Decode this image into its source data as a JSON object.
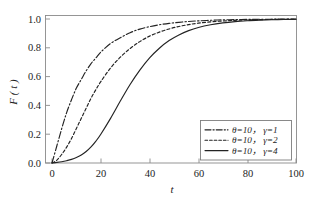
{
  "figure": {
    "background_color": "#ffffff",
    "frame_color": "#8a8a8a",
    "curve_color": "#232323"
  },
  "chart_data": {
    "type": "line",
    "title": "",
    "subtitle": "",
    "xlabel": "t",
    "ylabel": "F ( t )",
    "xlim": [
      0,
      100
    ],
    "ylim": [
      0.0,
      1.0
    ],
    "grid": false,
    "legend_position": "lower right",
    "xticks": [
      0,
      20,
      40,
      60,
      80,
      100
    ],
    "xtick_labels": [
      "0",
      "20",
      "40",
      "60",
      "80",
      "100"
    ],
    "yticks": [
      0.0,
      0.2,
      0.4,
      0.6,
      0.8,
      1.0
    ],
    "ytick_labels": [
      "0.0",
      "0.2",
      "0.4",
      "0.6",
      "0.8",
      "1.0"
    ],
    "x": [
      0,
      2,
      4,
      6,
      8,
      10,
      12,
      14,
      16,
      18,
      20,
      24,
      28,
      32,
      36,
      40,
      44,
      48,
      52,
      56,
      60,
      65,
      70,
      75,
      80,
      85,
      90,
      95,
      100
    ],
    "series": [
      {
        "name": "theta=10, gamma=1",
        "label": "θ=10， γ=1",
        "linestyle": "dashdot",
        "color": "#232323",
        "values": [
          0.0,
          0.12,
          0.24,
          0.35,
          0.44,
          0.52,
          0.58,
          0.64,
          0.69,
          0.73,
          0.77,
          0.83,
          0.87,
          0.905,
          0.93,
          0.947,
          0.96,
          0.97,
          0.977,
          0.983,
          0.987,
          0.991,
          0.994,
          0.9955,
          0.997,
          0.998,
          0.9985,
          0.999,
          0.9993
        ]
      },
      {
        "name": "theta=10, gamma=2",
        "label": "θ=10， γ=2",
        "linestyle": "dashed",
        "color": "#232323",
        "values": [
          0.0,
          0.02,
          0.06,
          0.11,
          0.17,
          0.24,
          0.31,
          0.38,
          0.45,
          0.51,
          0.565,
          0.66,
          0.735,
          0.795,
          0.843,
          0.881,
          0.909,
          0.931,
          0.948,
          0.961,
          0.971,
          0.98,
          0.986,
          0.9905,
          0.9935,
          0.9955,
          0.997,
          0.998,
          0.9987
        ]
      },
      {
        "name": "theta=10, gamma=4",
        "label": "θ=10， γ=4",
        "linestyle": "solid",
        "color": "#232323",
        "values": [
          0.0,
          0.004,
          0.009,
          0.016,
          0.025,
          0.038,
          0.056,
          0.08,
          0.112,
          0.152,
          0.2,
          0.31,
          0.43,
          0.545,
          0.645,
          0.73,
          0.797,
          0.85,
          0.889,
          0.919,
          0.941,
          0.96,
          0.973,
          0.982,
          0.988,
          0.992,
          0.995,
          0.9968,
          0.998
        ]
      }
    ],
    "annotations": []
  },
  "legend": {
    "entries": [
      {
        "label": "θ=10， γ=1",
        "style": "dashdot"
      },
      {
        "label": "θ=10， γ=2",
        "style": "dashed"
      },
      {
        "label": "θ=10， γ=4",
        "style": "solid"
      }
    ]
  }
}
